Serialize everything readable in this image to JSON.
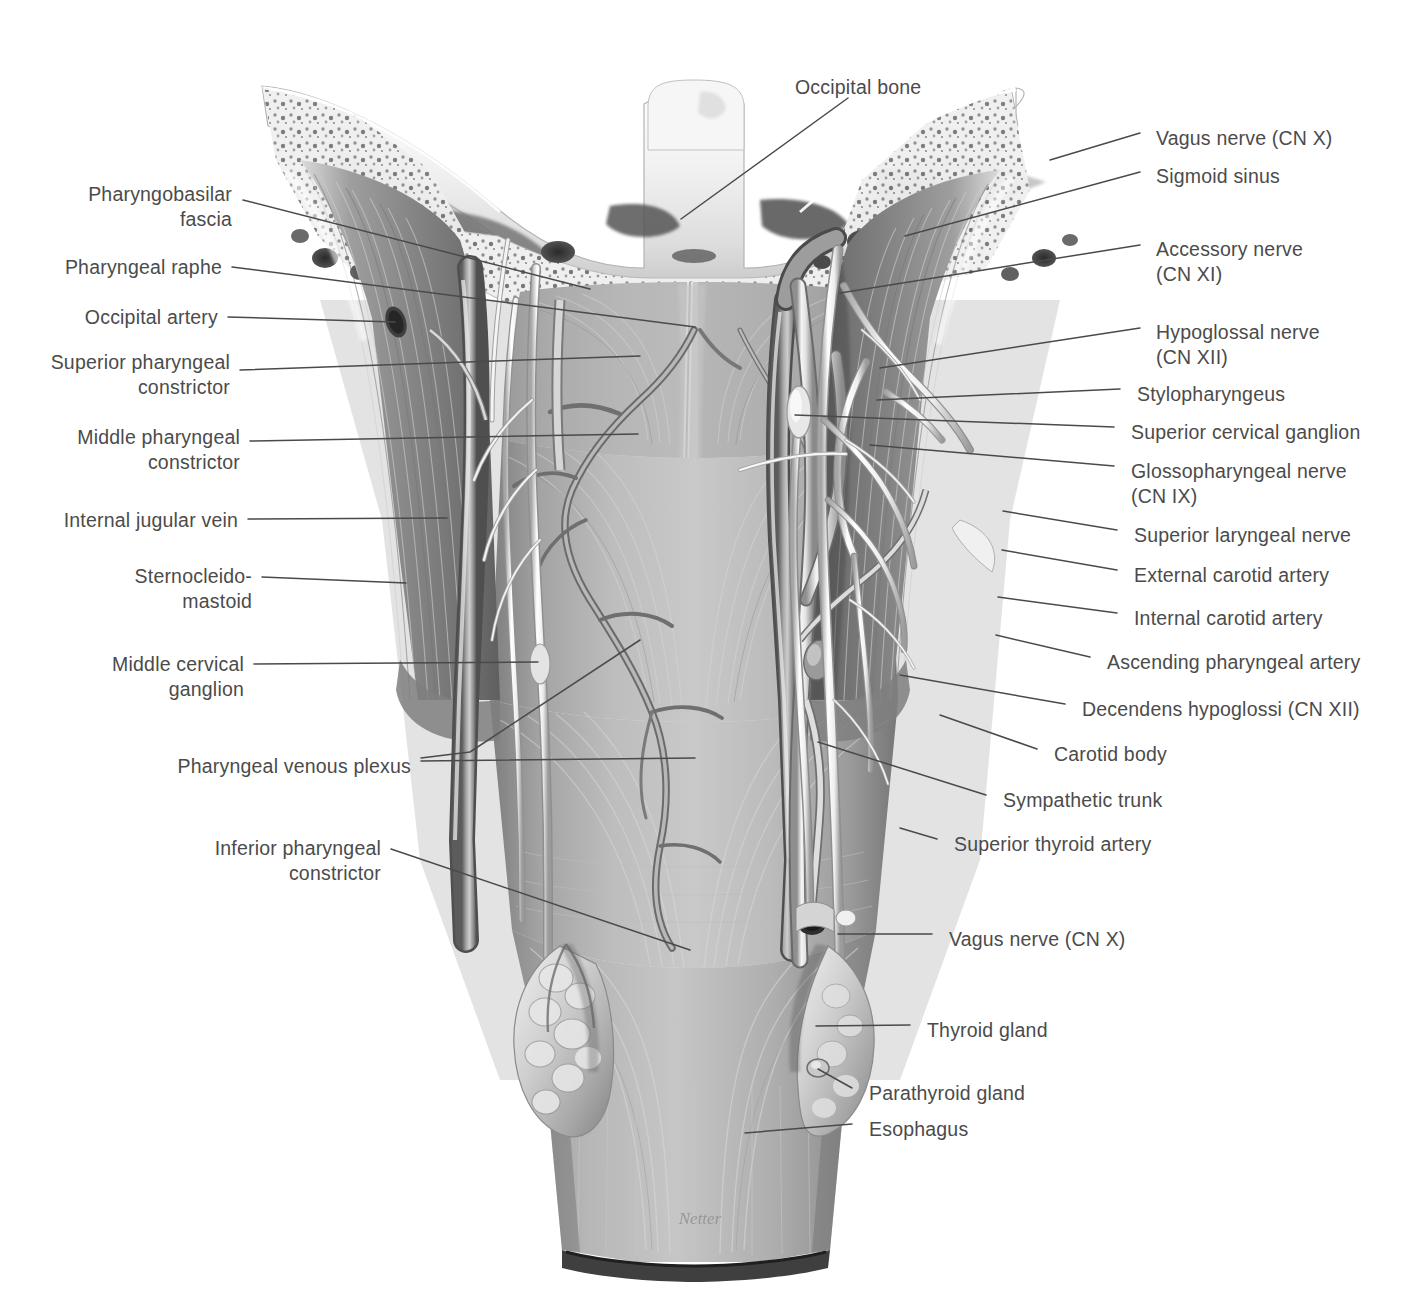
{
  "figure": {
    "artist_signature": "Netter",
    "colors": {
      "label_text": "#4b4b4b",
      "leader_line": "#4a4a4a",
      "rule": "#8d8d8d",
      "background": "#ffffff"
    }
  },
  "labels": {
    "top": [
      {
        "id": "occipital-bone",
        "text": "Occipital bone",
        "side": "top",
        "x": 795,
        "y": 75
      }
    ],
    "left": [
      {
        "id": "pharyngobasilar-fascia",
        "text": "Pharyngobasilar\nfascia",
        "x": 75,
        "y": 182
      },
      {
        "id": "pharyngeal-raphe",
        "text": "Pharyngeal raphe",
        "x": 61,
        "y": 255
      },
      {
        "id": "occipital-artery",
        "text": "Occipital artery",
        "x": 80,
        "y": 305
      },
      {
        "id": "superior-pharyngeal-constrictor",
        "text": "Superior pharyngeal\nconstrictor",
        "x": 47,
        "y": 350
      },
      {
        "id": "middle-pharyngeal-constrictor",
        "text": "Middle pharyngeal\nconstrictor",
        "x": 78,
        "y": 425
      },
      {
        "id": "internal-jugular-vein",
        "text": "Internal jugular vein",
        "x": 70,
        "y": 508
      },
      {
        "id": "sternocleidomastoid",
        "text": "Sternocleido-\nmastoid",
        "x": 125,
        "y": 564
      },
      {
        "id": "middle-cervical-ganglion",
        "text": "Middle cervical\nganglion",
        "x": 113,
        "y": 652
      },
      {
        "id": "pharyngeal-venous-plexus",
        "text": "Pharyngeal venous plexus",
        "x": 181,
        "y": 754
      },
      {
        "id": "inferior-pharyngeal-constrictor",
        "text": "Inferior pharyngeal\nconstrictor",
        "x": 212,
        "y": 836
      }
    ],
    "right": [
      {
        "id": "vagus-nerve-cn-x-upper",
        "text": "Vagus nerve (CN X)",
        "x": 1156,
        "y": 126
      },
      {
        "id": "sigmoid-sinus",
        "text": "Sigmoid sinus",
        "x": 1156,
        "y": 164
      },
      {
        "id": "accessory-nerve-cn-xi",
        "text": "Accessory nerve\n(CN XI)",
        "x": 1156,
        "y": 237
      },
      {
        "id": "hypoglossal-nerve-cn-xii",
        "text": "Hypoglossal nerve\n(CN XII)",
        "x": 1156,
        "y": 320
      },
      {
        "id": "stylopharyngeus",
        "text": "Stylopharyngeus",
        "x": 1137,
        "y": 382
      },
      {
        "id": "superior-cervical-ganglion",
        "text": "Superior cervical ganglion",
        "x": 1131,
        "y": 420
      },
      {
        "id": "glossopharyngeal-nerve-cn-ix",
        "text": "Glossopharyngeal nerve\n(CN IX)",
        "x": 1131,
        "y": 459
      },
      {
        "id": "superior-laryngeal-nerve",
        "text": "Superior laryngeal nerve",
        "x": 1134,
        "y": 523
      },
      {
        "id": "external-carotid-artery",
        "text": "External carotid artery",
        "x": 1134,
        "y": 563
      },
      {
        "id": "internal-carotid-artery",
        "text": "Internal carotid artery",
        "x": 1134,
        "y": 606
      },
      {
        "id": "ascending-pharyngeal-artery",
        "text": "Ascending pharyngeal artery",
        "x": 1107,
        "y": 650
      },
      {
        "id": "decendens-hypoglossi-cn-xii",
        "text": "Decendens hypoglossi (CN XII)",
        "x": 1082,
        "y": 697
      },
      {
        "id": "carotid-body",
        "text": "Carotid body",
        "x": 1054,
        "y": 742
      },
      {
        "id": "sympathetic-trunk",
        "text": "Sympathetic trunk",
        "x": 1003,
        "y": 788
      },
      {
        "id": "superior-thyroid-artery",
        "text": "Superior thyroid artery",
        "x": 954,
        "y": 832
      },
      {
        "id": "vagus-nerve-cn-x-lower",
        "text": "Vagus nerve (CN X)",
        "x": 949,
        "y": 927
      },
      {
        "id": "thyroid-gland",
        "text": "Thyroid gland",
        "x": 927,
        "y": 1018
      },
      {
        "id": "parathyroid-gland",
        "text": "Parathyroid gland",
        "x": 869,
        "y": 1081
      },
      {
        "id": "esophagus",
        "text": "Esophagus",
        "x": 869,
        "y": 1117
      }
    ]
  },
  "leader_lines": [
    {
      "id": "leader-occipital-bone",
      "points": "848,98 681,219"
    },
    {
      "id": "leader-pharyngobasilar",
      "points": "243,200 590,289"
    },
    {
      "id": "leader-pharyngeal-raphe",
      "points": "232,267 695,327"
    },
    {
      "id": "leader-occipital-artery",
      "points": "228,317 395,322"
    },
    {
      "id": "leader-sup-ph-constrictor",
      "points": "240,370 640,356"
    },
    {
      "id": "leader-mid-ph-constrictor",
      "points": "250,441 638,434"
    },
    {
      "id": "leader-internal-jugular",
      "points": "248,519 447,518"
    },
    {
      "id": "leader-sternocleidomastoid",
      "points": "262,577 406,583"
    },
    {
      "id": "leader-mid-cerv-ganglion",
      "points": "254,664 538,662"
    },
    {
      "id": "leader-ph-ven-plexus-a",
      "points": "421,758 470,752 640,640"
    },
    {
      "id": "leader-ph-ven-plexus-b",
      "points": "421,761 695,758"
    },
    {
      "id": "leader-inf-ph-constrictor",
      "points": "391,849 690,950"
    },
    {
      "id": "leader-vagus-upper",
      "points": "1140,133 1050,160"
    },
    {
      "id": "leader-sigmoid-sinus",
      "points": "1140,172 905,236"
    },
    {
      "id": "leader-accessory-nerve",
      "points": "1140,245 840,293"
    },
    {
      "id": "leader-hypoglossal",
      "points": "1140,328 880,368"
    },
    {
      "id": "leader-stylopharyngeus",
      "points": "1120,389 877,400"
    },
    {
      "id": "leader-sup-cerv-ganglion",
      "points": "1114,427 795,415"
    },
    {
      "id": "leader-glossopharyngeal",
      "points": "1114,466 870,445"
    },
    {
      "id": "leader-sup-laryngeal",
      "points": "1117,530 1003,511"
    },
    {
      "id": "leader-ext-carotid",
      "points": "1117,570 1002,550"
    },
    {
      "id": "leader-int-carotid",
      "points": "1117,613 998,597"
    },
    {
      "id": "leader-ascending-pharyngeal",
      "points": "1090,657 996,635"
    },
    {
      "id": "leader-decendens",
      "points": "1065,704 900,675"
    },
    {
      "id": "leader-carotid-body",
      "points": "1037,749 940,715"
    },
    {
      "id": "leader-sympathetic-trunk",
      "points": "986,795 818,742"
    },
    {
      "id": "leader-sup-thyroid-artery",
      "points": "937,839 900,828"
    },
    {
      "id": "leader-vagus-lower",
      "points": "932,934 838,934"
    },
    {
      "id": "leader-thyroid-gland",
      "points": "910,1025 816,1026"
    },
    {
      "id": "leader-parathyroid-gland",
      "points": "852,1088 818,1069"
    },
    {
      "id": "leader-esophagus",
      "points": "852,1124 745,1133"
    }
  ]
}
